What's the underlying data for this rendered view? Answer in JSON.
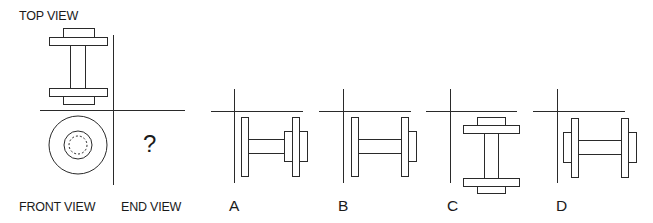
{
  "labels": {
    "top_view": "TOP VIEW",
    "front_view": "FRONT VIEW",
    "end_view": "END VIEW",
    "question_mark": "?"
  },
  "options": [
    {
      "letter": "A",
      "description": "side view: left flange, shaft, right hub + flange + outer hub"
    },
    {
      "letter": "B",
      "description": "side view: left flange, shaft, right flange + outer hub"
    },
    {
      "letter": "C",
      "description": "top-view-like vertical dumbbell with hubs on both ends"
    },
    {
      "letter": "D",
      "description": "side view: outer hubs on both flanges"
    }
  ],
  "colors": {
    "stroke": "#2a2a2a",
    "background": "#ffffff",
    "text": "#1a1a1a"
  }
}
